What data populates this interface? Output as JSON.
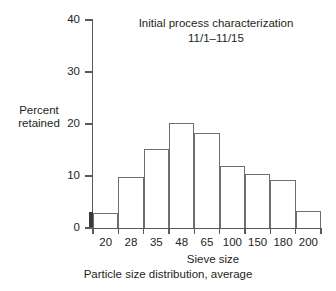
{
  "chart_data": {
    "type": "bar",
    "title": "Initial process characterization",
    "subtitle": "11/1–11/15",
    "xlabel": "Sieve size",
    "ylabel": "Percent retained",
    "ylabel_lines": [
      "Percent",
      "retained"
    ],
    "caption": "Particle size distribution, average",
    "categories": [
      "20",
      "28",
      "35",
      "48",
      "65",
      "100",
      "150",
      "180",
      "200"
    ],
    "values": [
      2.8,
      9.8,
      15.1,
      20.2,
      18.3,
      12.0,
      10.3,
      9.2,
      3.2
    ],
    "ylim": [
      0,
      40
    ],
    "yticks": [
      0,
      10,
      20,
      30,
      40
    ],
    "ytick_labels": [
      "0",
      "10",
      "20",
      "30",
      "40"
    ],
    "grid": false,
    "legend": null,
    "bar_fill": "#ffffff",
    "bar_edge": "#6d6e71",
    "axis_color": "#58595b",
    "text_color": "#231f20"
  }
}
